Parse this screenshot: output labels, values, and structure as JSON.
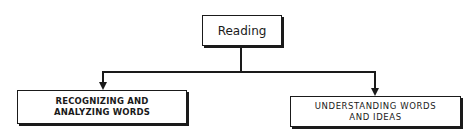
{
  "diagram": {
    "type": "hierarchy",
    "root": {
      "label": "Reading"
    },
    "children": [
      {
        "label_lines": [
          "RECOGNIZING AND",
          "ANALYZING WORDS"
        ]
      },
      {
        "label_lines": [
          "UNDERSTANDING WORDS",
          "AND IDEAS"
        ]
      }
    ],
    "colors": {
      "line": "#1a1a1a",
      "background": "#ffffff"
    }
  }
}
